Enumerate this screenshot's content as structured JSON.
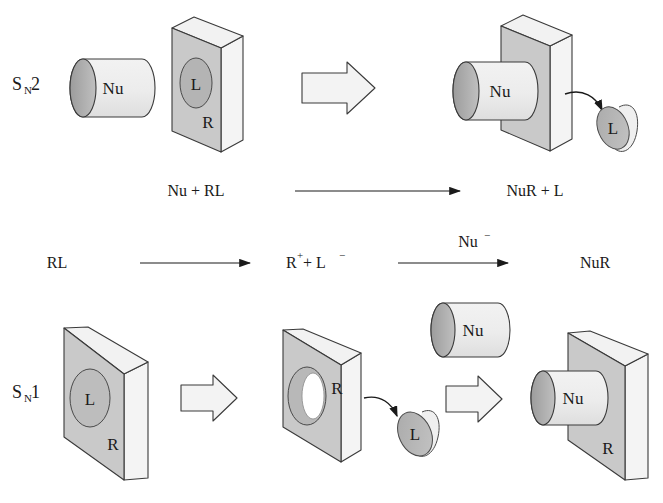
{
  "figure": {
    "background": "#ffffff"
  },
  "palette": {
    "slab_front": "#c9c9c9",
    "slab_top": "#f2f2f2",
    "slab_side": "#f4f4f4",
    "cylinder_body": "#ebebeb",
    "cylinder_cap": "#a9a9a9",
    "disc_face": "#b4b4b4",
    "disc_shadow": "#efefef",
    "arrow_block_fill": "#f3f3f3",
    "outline": "#3a3a3a",
    "text": "#1a1a1a",
    "hole_white": "#ffffff",
    "hole_ring": "#b0b0b0"
  },
  "rows": {
    "sn2": {
      "mechanism_label": "S",
      "mechanism_sub": "N",
      "mechanism_num": "2",
      "reactant_cylinder_label": "Nu",
      "reactant_slab_disc_label": "L",
      "reactant_slab_label": "R",
      "transform_arrow": "block-arrow-right",
      "product_cylinder_label": "Nu",
      "product_slab_label": "",
      "leaving_disc_label": "L",
      "equation_left": "Nu + RL",
      "equation_right": "NuR + L"
    },
    "ionization": {
      "start": "RL",
      "intermediate": "R",
      "intermediate_sup": "+",
      "intermediate_plus": " + L",
      "intermediate_sup2": "−",
      "reagent": "Nu",
      "reagent_sup": "−",
      "product": "NuR"
    },
    "sn1": {
      "mechanism_label": "S",
      "mechanism_sub": "N",
      "mechanism_num": "1",
      "step1_disc_label": "L",
      "step1_slab_label": "R",
      "transform_arrow_1": "block-arrow-right",
      "step2_slab_label": "R",
      "step2_leaving_disc_label": "L",
      "free_cylinder_label": "Nu",
      "transform_arrow_2": "block-arrow-right",
      "product_cylinder_label": "Nu",
      "product_slab_label": "R"
    }
  }
}
